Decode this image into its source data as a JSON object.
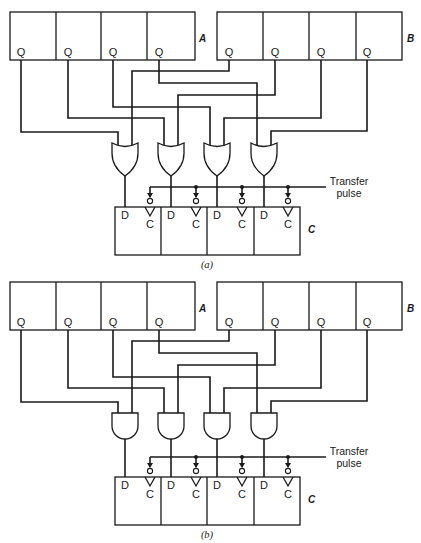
{
  "figure": {
    "panels": [
      {
        "id": "a",
        "caption": "(a)",
        "gate_type": "OR",
        "register_a": {
          "name": "A",
          "cells": [
            "Q",
            "Q",
            "Q",
            "Q"
          ]
        },
        "register_b": {
          "name": "B",
          "cells": [
            "Q",
            "Q",
            "Q",
            "Q"
          ]
        },
        "register_c": {
          "name": "C",
          "cells": [
            {
              "d": "D",
              "c": "C"
            },
            {
              "d": "D",
              "c": "C"
            },
            {
              "d": "D",
              "c": "C"
            },
            {
              "d": "D",
              "c": "C"
            }
          ]
        },
        "control": {
          "line1": "Transfer",
          "line2": "pulse"
        }
      },
      {
        "id": "b",
        "caption": "(b)",
        "gate_type": "AND",
        "register_a": {
          "name": "A",
          "cells": [
            "Q",
            "Q",
            "Q",
            "Q"
          ]
        },
        "register_b": {
          "name": "B",
          "cells": [
            "Q",
            "Q",
            "Q",
            "Q"
          ]
        },
        "register_c": {
          "name": "C",
          "cells": [
            {
              "d": "D",
              "c": "C"
            },
            {
              "d": "D",
              "c": "C"
            },
            {
              "d": "D",
              "c": "C"
            },
            {
              "d": "D",
              "c": "C"
            }
          ]
        },
        "control": {
          "line1": "Transfer",
          "line2": "pulse"
        }
      }
    ]
  }
}
